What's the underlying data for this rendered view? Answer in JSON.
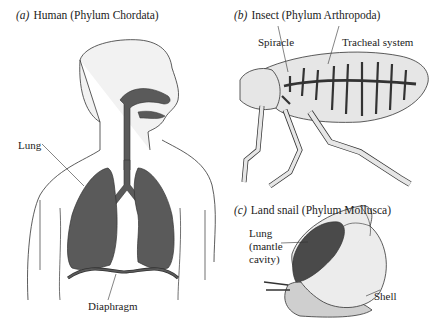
{
  "panels": [
    {
      "letter": "(a)",
      "title": "Human (Phylum Chordata)",
      "labels": {
        "lung": "Lung",
        "diaphragm": "Diaphragm"
      }
    },
    {
      "letter": "(b)",
      "title": "Insect (Phylum Arthropoda)",
      "labels": {
        "spiracle": "Spiracle",
        "tracheal": "Tracheal system"
      }
    },
    {
      "letter": "(c)",
      "title": "Land snail (Phylum Mollusca)",
      "labels": {
        "lung1": "Lung",
        "lung2": "(mantle",
        "lung3": "cavity)",
        "shell": "Shell"
      }
    }
  ],
  "colors": {
    "organ": "#5a5a5a",
    "skin": "#f0f0f0",
    "outline": "#333333",
    "insect_body": "#e6e6e6",
    "shell": "#ececec",
    "snail_body": "#cfcfcf"
  }
}
